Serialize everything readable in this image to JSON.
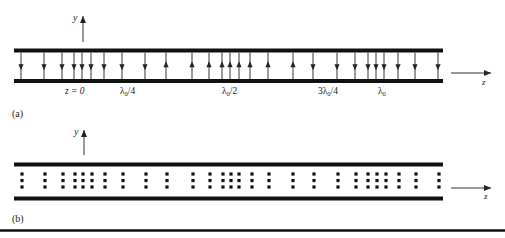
{
  "figure": {
    "colors": {
      "plate": "#111111",
      "arrow": "#222222",
      "dot": "#111111",
      "text": "#222222",
      "axis": "#333333"
    },
    "panel_a": {
      "label": "(a)",
      "y_axis_label": "y",
      "z_axis_label": "z",
      "plates": {
        "x1": 14,
        "x2": 443,
        "top_y": 50.5,
        "bottom_y": 81
      },
      "field_lines": [
        {
          "x": 21,
          "dir": "down"
        },
        {
          "x": 44,
          "dir": "down"
        },
        {
          "x": 62,
          "dir": "down"
        },
        {
          "x": 74,
          "dir": "down"
        },
        {
          "x": 82,
          "dir": "down"
        },
        {
          "x": 91,
          "dir": "down"
        },
        {
          "x": 104,
          "dir": "down"
        },
        {
          "x": 122,
          "dir": "down"
        },
        {
          "x": 145,
          "dir": "down"
        },
        {
          "x": 166,
          "dir": "up"
        },
        {
          "x": 192,
          "dir": "up"
        },
        {
          "x": 209,
          "dir": "up"
        },
        {
          "x": 222,
          "dir": "up"
        },
        {
          "x": 230,
          "dir": "up"
        },
        {
          "x": 239,
          "dir": "up"
        },
        {
          "x": 250,
          "dir": "up"
        },
        {
          "x": 268,
          "dir": "up"
        },
        {
          "x": 293,
          "dir": "up"
        },
        {
          "x": 313,
          "dir": "down"
        },
        {
          "x": 337,
          "dir": "down"
        },
        {
          "x": 355,
          "dir": "down"
        },
        {
          "x": 368,
          "dir": "down"
        },
        {
          "x": 376,
          "dir": "down"
        },
        {
          "x": 384,
          "dir": "down"
        },
        {
          "x": 398,
          "dir": "down"
        },
        {
          "x": 415,
          "dir": "down"
        },
        {
          "x": 438,
          "dir": "down"
        }
      ],
      "position_labels": [
        {
          "text": "z = 0",
          "x": 65
        },
        {
          "text": "λ0/4",
          "x": 120,
          "main": "λ",
          "sub": "0",
          "tail": "/4"
        },
        {
          "text": "λ0/2",
          "x": 222,
          "main": "λ",
          "sub": "0",
          "tail": "/2"
        },
        {
          "text": "3λ0/4",
          "x": 318,
          "main": "3λ",
          "sub": "0",
          "tail": "/4"
        },
        {
          "text": "λ0",
          "x": 378,
          "main": "λ",
          "sub": "0",
          "tail": ""
        }
      ]
    },
    "panel_b": {
      "label": "(b)",
      "y_axis_label": "y",
      "z_axis_label": "z",
      "plates": {
        "x1": 14,
        "x2": 443,
        "top_y": 164.5,
        "bottom_y": 198.5
      },
      "charge_columns_x": [
        22,
        45,
        63,
        75,
        83,
        92,
        105,
        123,
        146,
        167,
        193,
        210,
        223,
        231,
        239,
        252,
        269,
        293,
        314,
        338,
        356,
        368,
        377,
        386,
        399,
        416,
        439
      ],
      "charge_rows_y": [
        174,
        180.5,
        187
      ]
    }
  }
}
